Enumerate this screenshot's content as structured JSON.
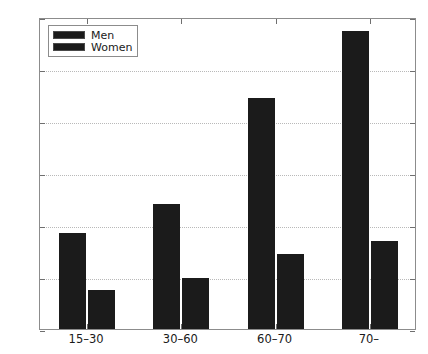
{
  "chart_data": {
    "type": "bar",
    "title": "",
    "xlabel": "",
    "ylabel": "",
    "categories": [
      "15–30",
      "30–60",
      "60–70",
      "70–"
    ],
    "series": [
      {
        "name": "Men",
        "values": [
          37,
          48,
          89,
          114.5
        ],
        "color": "#1b1b1b"
      },
      {
        "name": "Women",
        "values": [
          15,
          19.5,
          29,
          34
        ],
        "color": "#1b1b1b"
      }
    ],
    "ylim": [
      0,
      120
    ],
    "yticks": [
      0,
      20,
      40,
      60,
      80,
      100,
      120
    ],
    "ytick_labels": [
      "0",
      "20",
      "40",
      "60",
      "80",
      "100",
      "120"
    ],
    "grid": true,
    "grid_axis": "y",
    "legend_position": "upper left",
    "axis_color": "#8c8c8c",
    "grid_color": "#b9b9b9",
    "background": "#ffffff"
  },
  "legend": {
    "entries": [
      {
        "label": "Men"
      },
      {
        "label": "Women"
      }
    ]
  }
}
